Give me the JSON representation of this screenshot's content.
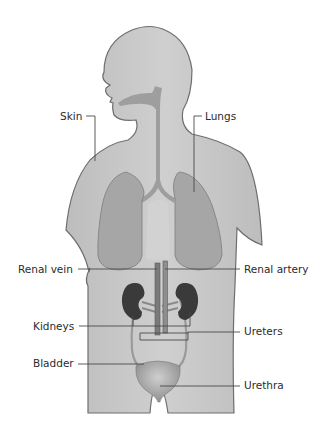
{
  "diagram": {
    "colors": {
      "background": "#ffffff",
      "body_fill": "#c9c9c9",
      "body_outline": "#6e6e6e",
      "lungs": "#a6a6a6",
      "airway": "#9e9e9e",
      "kidneys": "#3a3a3a",
      "vessels": "#8a8a8a",
      "bladder": "#b5b5b5",
      "leader_line": "#4a4a4a",
      "label_text": "#2b2b2b"
    },
    "labels": {
      "skin": "Skin",
      "lungs": "Lungs",
      "renal_vein": "Renal vein",
      "renal_artery": "Renal artery",
      "kidneys": "Kidneys",
      "ureters": "Ureters",
      "bladder": "Bladder",
      "urethra": "Urethra"
    }
  }
}
